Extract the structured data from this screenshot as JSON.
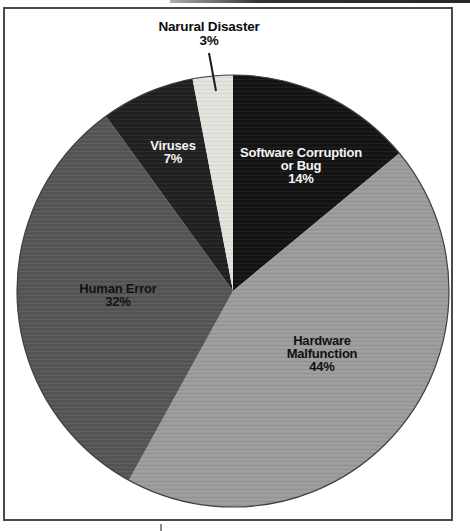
{
  "figure": {
    "background": "#ffffff",
    "frame_color": "#4a4a4a",
    "pie_outline_color": "#3f3f3f",
    "leader_line_color": "#1a1a1a"
  },
  "chart_data": {
    "type": "pie",
    "title": "",
    "categories": [
      "Software Corruption or Bug",
      "Hardware Malfunction",
      "Human Error",
      "Viruses",
      "Narural Disaster"
    ],
    "values": [
      14,
      44,
      32,
      7,
      3
    ],
    "unit": "%",
    "colors": [
      "#141414",
      "#9c9c9c",
      "#565656",
      "#212121",
      "#e4e3de"
    ],
    "start_angle_deg": 0,
    "direction": "clockwise",
    "legend_position": "none",
    "labels_on_slices": true
  },
  "labels": {
    "natural_disaster": {
      "name": "Narural Disaster",
      "pct": "3%"
    },
    "viruses": {
      "name": "Viruses",
      "pct": "7%"
    },
    "software": {
      "line1": "Software Corruption",
      "line2": "or Bug",
      "pct": "14%"
    },
    "human_error": {
      "name": "Human Error",
      "pct": "32%"
    },
    "hardware": {
      "line1": "Hardware",
      "line2": "Malfunction",
      "pct": "44%"
    }
  }
}
